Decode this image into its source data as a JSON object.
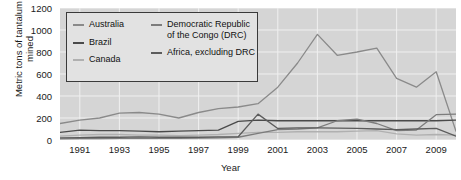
{
  "chart_data": {
    "type": "line",
    "title": "",
    "xlabel": "Year",
    "ylabel": "Metric tons of tantalum mined",
    "xlim": [
      1990,
      2010
    ],
    "ylim": [
      0,
      1200
    ],
    "yticks": [
      0,
      200,
      400,
      600,
      800,
      1000,
      1200
    ],
    "xticks": [
      1991,
      1993,
      1995,
      1997,
      1999,
      2001,
      2003,
      2005,
      2007,
      2009
    ],
    "grid": true,
    "legend_position": "top-left",
    "x": [
      1990,
      1991,
      1992,
      1993,
      1994,
      1995,
      1996,
      1997,
      1998,
      1999,
      2000,
      2001,
      2002,
      2003,
      2004,
      2005,
      2006,
      2007,
      2008,
      2009,
      2010
    ],
    "series": [
      {
        "name": "Australia",
        "color": "#8a8a8a",
        "values": [
          150,
          180,
          200,
          245,
          250,
          235,
          200,
          250,
          285,
          300,
          330,
          480,
          700,
          960,
          770,
          800,
          835,
          560,
          480,
          620,
          80
        ]
      },
      {
        "name": "Brazil",
        "color": "#4a4a4a",
        "values": [
          70,
          90,
          85,
          85,
          80,
          75,
          80,
          85,
          90,
          170,
          180,
          175,
          175,
          175,
          175,
          175,
          175,
          175,
          175,
          175,
          180
        ]
      },
      {
        "name": "Canada",
        "color": "#b0b0b0",
        "values": [
          35,
          45,
          50,
          50,
          45,
          45,
          40,
          45,
          50,
          60,
          70,
          70,
          75,
          75,
          75,
          80,
          85,
          55,
          45,
          50,
          45
        ]
      },
      {
        "name": "Democratic Republic of the Congo (DRC)",
        "color": "#7c7c7c",
        "values": [
          10,
          12,
          12,
          15,
          15,
          15,
          15,
          18,
          20,
          25,
          60,
          95,
          100,
          110,
          175,
          190,
          150,
          85,
          90,
          230,
          235
        ]
      },
      {
        "name": "Africa, excluding DRC",
        "color": "#5c5c5c",
        "values": [
          20,
          22,
          25,
          25,
          28,
          25,
          25,
          25,
          28,
          30,
          235,
          105,
          110,
          110,
          108,
          105,
          100,
          95,
          100,
          105,
          35
        ]
      }
    ]
  },
  "legend": {
    "column_left": [
      {
        "label": "Australia",
        "color": "#8a8a8a"
      },
      {
        "label": "Brazil",
        "color": "#4a4a4a"
      },
      {
        "label": "Canada",
        "color": "#b0b0b0"
      }
    ],
    "column_right": [
      {
        "label": "Democratic Republic of the Congo (DRC)",
        "color": "#7c7c7c"
      },
      {
        "label": "Africa, excluding DRC",
        "color": "#5c5c5c"
      }
    ]
  }
}
